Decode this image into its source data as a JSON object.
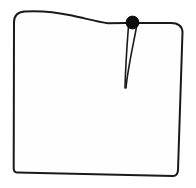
{
  "figure": {
    "kind": "line-drawing",
    "canvas": {
      "width": 196,
      "height": 188
    },
    "background_color": "#ffffff",
    "ink_color": "#1a1a1a",
    "fill_color": "#fefefe",
    "marker_color": "#0d0d0d",
    "stroke_width": 2
  },
  "shapes": {
    "panel": {
      "name": "panel-outline",
      "description": "Quadrilateral panel with rounded upper corners, a curved upper edge that rises then falls toward the right, a near-vertical left edge, a slightly inward-slanting right edge and a gently sloping bottom edge.",
      "path": "M 14 22 C 14 15 18 12 25 11.5 C 40 10.5 55 12 72 15.5 C 88 19 98 22 108 23.2 L 126 23 L 171 23 C 178 23 182 26 182.5 32 L 178 170 C 177.8 174 176 176 173 176 L 17 172.5 C 14.5 172.4 13.6 171 13.7 168 Z",
      "vertices_hint": [
        [
          14,
          22
        ],
        [
          25,
          11.5
        ],
        [
          72,
          15.5
        ],
        [
          108,
          23.2
        ],
        [
          171,
          23
        ],
        [
          182.5,
          32
        ],
        [
          178,
          170
        ],
        [
          17,
          172.5
        ]
      ]
    },
    "dart": {
      "name": "dart",
      "description": "A narrow V-shaped dart opening at the top edge, converging to a point near the middle of the panel.",
      "left_leg_path": "M 128.5 26 C 127 45 125.5 68 125 88",
      "right_leg_path": "M 136.5 27 C 133 46 127.5 70 126 88",
      "apex": [
        126,
        88
      ],
      "opening_top": [
        128,
        24
      ],
      "opening_width": 8,
      "length": 64
    },
    "dart_point_marker": {
      "name": "dart-point-marker",
      "description": "Solid filled circle marking the dart intake at the top edge.",
      "cx": 132.5,
      "cy": 22.5,
      "r": 6.4
    }
  },
  "noise_marks": [
    {
      "cx": 160,
      "cy": 44,
      "rx": 5,
      "ry": 2.2
    },
    {
      "cx": 157,
      "cy": 52,
      "rx": 4,
      "ry": 1.8
    },
    {
      "cx": 62,
      "cy": 150,
      "rx": 6,
      "ry": 2.0
    },
    {
      "cx": 95,
      "cy": 120,
      "rx": 4,
      "ry": 1.6
    }
  ]
}
